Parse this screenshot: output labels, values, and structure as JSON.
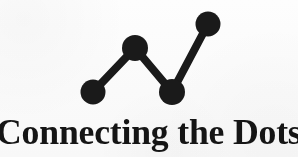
{
  "logo": {
    "wordmark": "Connecting the Dots",
    "background_color": "#fdfdfd",
    "ink_color": "#1a1a1a",
    "text_color": "#151515"
  },
  "chart_data": {
    "type": "line",
    "title": "Connecting the Dots",
    "xlabel": "",
    "ylabel": "",
    "grid": false,
    "legend": false,
    "categories": [
      "1",
      "2",
      "3",
      "4"
    ],
    "x": [
      93,
      135,
      172,
      208
    ],
    "values": [
      92,
      48,
      92,
      24
    ],
    "ylim": [
      24,
      92
    ],
    "marker": "circle",
    "marker_radius": 12,
    "line_width": 8,
    "series": [
      {
        "name": "dots",
        "points": [
          {
            "label": "dot-1",
            "x": 93,
            "y": 92
          },
          {
            "label": "dot-2",
            "x": 135,
            "y": 48
          },
          {
            "label": "dot-3",
            "x": 172,
            "y": 92
          },
          {
            "label": "dot-4",
            "x": 208,
            "y": 24
          }
        ]
      }
    ]
  }
}
